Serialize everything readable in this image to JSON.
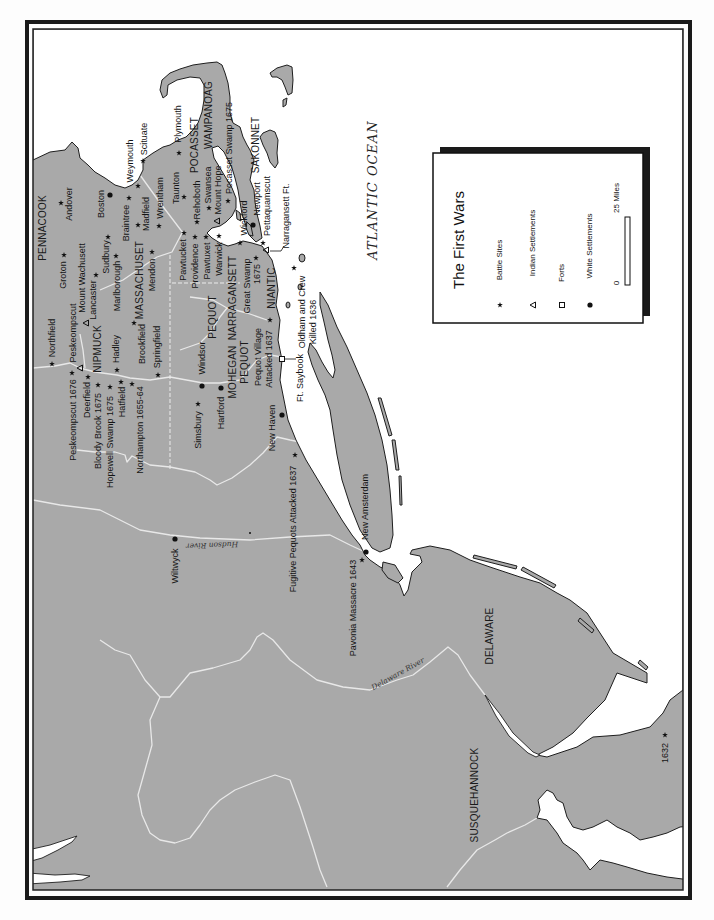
{
  "map": {
    "legend": {
      "title": "The First Wars",
      "items": [
        {
          "symbol": "star-icon",
          "label": "Battle Sites"
        },
        {
          "symbol": "triangle-icon",
          "label": "Indian Settlements"
        },
        {
          "symbol": "square-icon",
          "label": "Forts"
        },
        {
          "symbol": "dot-icon",
          "label": "White Settlements"
        }
      ],
      "scale": {
        "min": "0",
        "max": "25 Miles"
      }
    },
    "water_labels": {
      "ocean": "ATLANTIC OCEAN",
      "hudson_river": "Hudson River",
      "delaware_river": "Delaware River"
    },
    "regions": [
      {
        "name": "PENNACOOK"
      },
      {
        "name": "NIPMUCK"
      },
      {
        "name": "MASSACHUSET"
      },
      {
        "name": "POCASSET"
      },
      {
        "name": "WAMPANOAG"
      },
      {
        "name": "SAKONNET"
      },
      {
        "name": "NARRAGANSETT"
      },
      {
        "name": "NIANTIC"
      },
      {
        "name": "PEQUOT"
      },
      {
        "name": "MOHEGAN"
      },
      {
        "name": "PEQUOT"
      },
      {
        "name": "DELAWARE"
      },
      {
        "name": "SUSQUEHANNOCK"
      }
    ],
    "places": [
      {
        "name": "Andover",
        "symbol": "star"
      },
      {
        "name": "Groton",
        "symbol": "star"
      },
      {
        "name": "Boston",
        "symbol": "dot"
      },
      {
        "name": "Sudbury",
        "symbol": "star"
      },
      {
        "name": "Marlborough",
        "symbol": "star"
      },
      {
        "name": "Lancaster",
        "symbol": "star"
      },
      {
        "name": "Mount Wachusett",
        "symbol": "triangle"
      },
      {
        "name": "Weymouth",
        "symbol": "star"
      },
      {
        "name": "Scituate",
        "symbol": "star"
      },
      {
        "name": "Plymouth",
        "symbol": "star"
      },
      {
        "name": "Braintree",
        "symbol": "star"
      },
      {
        "name": "Madfield",
        "symbol": "star"
      },
      {
        "name": "Wrentham",
        "symbol": "star"
      },
      {
        "name": "Mendon",
        "symbol": "star"
      },
      {
        "name": "Taunton",
        "symbol": "star"
      },
      {
        "name": "Rehoboth",
        "symbol": "star"
      },
      {
        "name": "Swansea",
        "symbol": "star"
      },
      {
        "name": "Mount Hope",
        "symbol": "triangle"
      },
      {
        "name": "Pocasset Swamp 1675",
        "symbol": "star"
      },
      {
        "name": "Newport",
        "symbol": "dot"
      },
      {
        "name": "Wickford",
        "symbol": "star"
      },
      {
        "name": "Pettaquamscut",
        "symbol": "star"
      },
      {
        "name": "Narragansett Ft.",
        "symbol": "triangle"
      },
      {
        "name": "Pawtucket",
        "symbol": "star"
      },
      {
        "name": "Providence",
        "symbol": "star"
      },
      {
        "name": "Pawtuxet",
        "symbol": "star"
      },
      {
        "name": "Warwick",
        "symbol": "star"
      },
      {
        "line1": "Great Swamp",
        "line2": "1675",
        "symbol": "star"
      },
      {
        "line1": "Oldham and Crew",
        "line2": "Killed 1636",
        "symbol": "star"
      },
      {
        "name": "Northfield",
        "symbol": "star"
      },
      {
        "name": "Peskeompscut",
        "symbol": "triangle"
      },
      {
        "name": "Hadley",
        "symbol": "star"
      },
      {
        "name": "Brookfield",
        "symbol": "star"
      },
      {
        "name": "Springfield",
        "symbol": "star"
      },
      {
        "name": "Peskeompscut 1676",
        "symbol": "star"
      },
      {
        "name": "Deerfield",
        "symbol": "star"
      },
      {
        "name": "Bloody Brook 1675",
        "symbol": "star"
      },
      {
        "name": "Hopewell Swamp 1675",
        "symbol": "star"
      },
      {
        "name": "Hatfield",
        "symbol": "star"
      },
      {
        "name": "Northampton 1655-64",
        "symbol": "star"
      },
      {
        "name": "Windsor",
        "symbol": "dot"
      },
      {
        "name": "Hartford",
        "symbol": "dot"
      },
      {
        "name": "Simsbury",
        "symbol": "star"
      },
      {
        "line1": "Pequot Village",
        "line2": "Attacked 1637",
        "symbol": "star"
      },
      {
        "name": "Ft. Saybook",
        "symbol": "square"
      },
      {
        "name": "New Haven",
        "symbol": "dot"
      },
      {
        "name": "Fugitive Pequots Attacked 1637",
        "symbol": "star"
      },
      {
        "name": "New Amsterdam",
        "symbol": "dot"
      },
      {
        "name": "Pavonia Massacre 1643",
        "symbol": "star"
      },
      {
        "name": "Wiltwyck",
        "symbol": "dot"
      },
      {
        "name": "1632",
        "symbol": "star"
      }
    ],
    "colors": {
      "land": "#a9a9a9",
      "water": "#ffffff",
      "coastline": "#1e1e1e",
      "rivers": "#e8e8e8",
      "frame": "#1a1a1a"
    }
  }
}
